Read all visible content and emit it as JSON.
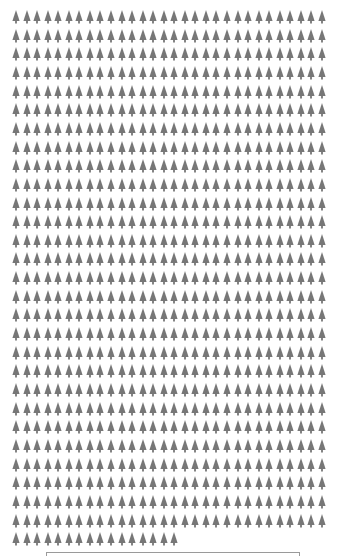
{
  "chart_data": {
    "type": "pictogram",
    "icon": "tree-icon",
    "icon_color": "#777777",
    "columns": 30,
    "rows": 29,
    "full_rows": 28,
    "last_row_count": 16,
    "total_icons": 856,
    "title": "",
    "legend": {
      "visible": true,
      "text": ""
    }
  }
}
